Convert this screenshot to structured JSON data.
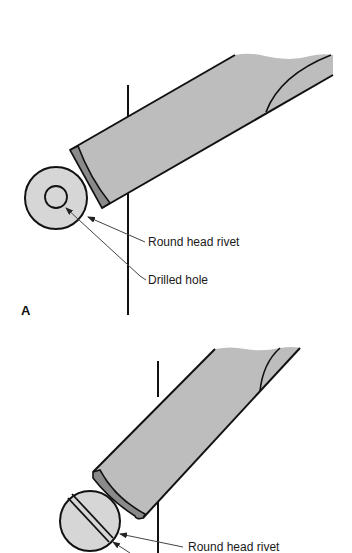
{
  "figure": {
    "panels": [
      {
        "id": "A",
        "letter": "A",
        "labels": {
          "rivet": "Round head rivet",
          "hole": "Drilled hole"
        }
      },
      {
        "id": "B",
        "labels": {
          "rivet": "Round head rivet"
        }
      }
    ],
    "colors": {
      "chisel_body": "#bdbdbd",
      "chisel_tip": "#8a8a8a",
      "rivet_fill": "#d6d6d6",
      "outline": "#111111",
      "leader": "#444444"
    }
  }
}
